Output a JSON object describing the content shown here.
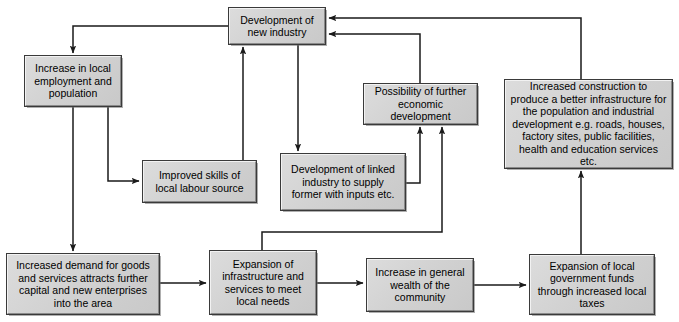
{
  "diagram": {
    "type": "flowchart",
    "background_color": "#ffffff",
    "node_fill_color": "#d4d4d4",
    "node_border_color": "#3a3a3a",
    "edge_color": "#1a1a1a",
    "nodes": [
      {
        "id": "new_industry",
        "label": "Development of new industry",
        "x": 229,
        "y": 8,
        "w": 96,
        "h": 36
      },
      {
        "id": "employment",
        "label": "Increase in local employment and population",
        "x": 25,
        "y": 56,
        "w": 96,
        "h": 50
      },
      {
        "id": "skills",
        "label": "Improved skills of local labour source",
        "x": 143,
        "y": 161,
        "w": 113,
        "h": 41
      },
      {
        "id": "linked_industry",
        "label": "Development of linked industry to supply former with inputs etc.",
        "x": 281,
        "y": 154,
        "w": 124,
        "h": 56
      },
      {
        "id": "further_development",
        "label": "Possibility of further economic development",
        "x": 364,
        "y": 84,
        "w": 113,
        "h": 40
      },
      {
        "id": "construction",
        "label": "Increased construction to produce a better infrastructure for the population and industrial development e.g. roads, houses, factory sites, public facilities, health and education services etc.",
        "x": 505,
        "y": 80,
        "w": 167,
        "h": 88
      },
      {
        "id": "demand",
        "label": "Increased demand for goods and services attracts further capital and new enterprises into the area",
        "x": 7,
        "y": 254,
        "w": 152,
        "h": 60
      },
      {
        "id": "infrastructure",
        "label": "Expansion of infrastructure and services to meet local needs",
        "x": 210,
        "y": 251,
        "w": 106,
        "h": 63
      },
      {
        "id": "wealth",
        "label": "Increase in general wealth of the community",
        "x": 367,
        "y": 259,
        "w": 106,
        "h": 52
      },
      {
        "id": "gov_funds",
        "label": "Expansion of local government funds through increased local taxes",
        "x": 530,
        "y": 255,
        "w": 124,
        "h": 59
      }
    ],
    "edges": [
      {
        "from": "new_industry",
        "to": "employment",
        "label": ""
      },
      {
        "from": "employment",
        "to": "skills",
        "label": ""
      },
      {
        "from": "employment",
        "to": "demand",
        "label": ""
      },
      {
        "from": "skills",
        "to": "new_industry",
        "label": ""
      },
      {
        "from": "new_industry",
        "to": "linked_industry",
        "label": ""
      },
      {
        "from": "linked_industry",
        "to": "further_development",
        "label": ""
      },
      {
        "from": "further_development",
        "to": "new_industry",
        "label": ""
      },
      {
        "from": "demand",
        "to": "infrastructure",
        "label": ""
      },
      {
        "from": "infrastructure",
        "to": "further_development",
        "label": ""
      },
      {
        "from": "infrastructure",
        "to": "wealth",
        "label": ""
      },
      {
        "from": "wealth",
        "to": "gov_funds",
        "label": ""
      },
      {
        "from": "gov_funds",
        "to": "construction",
        "label": ""
      },
      {
        "from": "construction",
        "to": "new_industry",
        "label": ""
      }
    ]
  }
}
